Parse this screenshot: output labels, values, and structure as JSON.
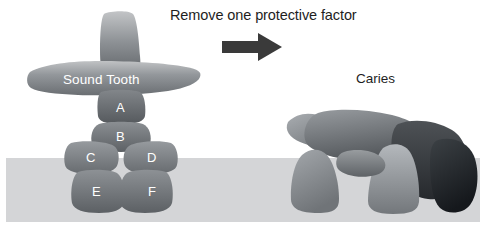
{
  "canvas": {
    "width": 488,
    "height": 233,
    "background": "#ffffff"
  },
  "header": {
    "caption": "Remove one protective factor"
  },
  "arrow": {
    "name": "right-arrow-icon",
    "color": "#3a3a3a",
    "x": 222,
    "y": 40,
    "width": 58,
    "height": 16
  },
  "ground": {
    "label": "ground-band",
    "color": "#d4d5d7",
    "x": 6,
    "y": 158,
    "width": 474,
    "height": 64
  },
  "left_diagram": {
    "title": "Sound Tooth",
    "title_color": "#ffffff",
    "blocks": [
      {
        "id": "top",
        "label": "",
        "fill_light": "#b9bbbd",
        "fill_dark": "#62666a"
      },
      {
        "id": "crossbar",
        "label": "Sound Tooth",
        "fill_light": "#b9bbbd",
        "fill_dark": "#6d7074"
      },
      {
        "id": "A",
        "label": "A",
        "fill_light": "#7b7f83",
        "fill_dark": "#595d61"
      },
      {
        "id": "B",
        "label": "B",
        "fill_light": "#84888c",
        "fill_dark": "#5f6367"
      },
      {
        "id": "C",
        "label": "C",
        "fill_light": "#8c9094",
        "fill_dark": "#666a6e"
      },
      {
        "id": "D",
        "label": "D",
        "fill_light": "#8c9094",
        "fill_dark": "#666a6e"
      },
      {
        "id": "E",
        "label": "E",
        "fill_light": "#838790",
        "fill_dark": "#5c6064"
      },
      {
        "id": "F",
        "label": "F",
        "fill_light": "#838790",
        "fill_dark": "#5c6064"
      }
    ]
  },
  "right_diagram": {
    "title": "Caries",
    "title_color": "#1e1e1e",
    "state": "collapsed",
    "blocks": [
      {
        "id": "r1",
        "fill_light": "#9a9ea2",
        "fill_dark": "#6a6e72"
      },
      {
        "id": "r2",
        "fill_light": "#8e9296",
        "fill_dark": "#5a5e62"
      },
      {
        "id": "r3",
        "fill_light": "#4a4e52",
        "fill_dark": "#2b2f33"
      },
      {
        "id": "r4",
        "fill_light": "#9aa0a4",
        "fill_dark": "#6f7377"
      },
      {
        "id": "r5",
        "fill_light": "#a8acb0",
        "fill_dark": "#74787c"
      },
      {
        "id": "r6",
        "fill_light": "#353a3e",
        "fill_dark": "#1c2024"
      },
      {
        "id": "r7",
        "fill_light": "#8c9094",
        "fill_dark": "#5e6266"
      }
    ]
  },
  "labels": {
    "A": "A",
    "B": "B",
    "C": "C",
    "D": "D",
    "E": "E",
    "F": "F"
  }
}
